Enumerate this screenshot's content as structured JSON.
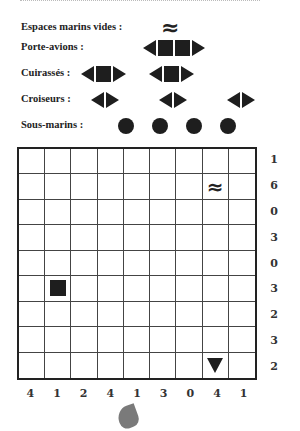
{
  "legend": {
    "water": {
      "label": "Espaces marins vides :",
      "symbol": "≈"
    },
    "carrier": {
      "label": "Porte-avions :",
      "count": 1,
      "length": 4
    },
    "battleship": {
      "label": "Cuirassés :",
      "count": 2,
      "length": 3
    },
    "cruiser": {
      "label": "Croiseurs :",
      "count": 3,
      "length": 2
    },
    "submarine": {
      "label": "Sous-marins :",
      "count": 4,
      "length": 1
    }
  },
  "grid": {
    "rows": 9,
    "cols": 9,
    "row_clues": [
      "1",
      "6",
      "0",
      "3",
      "0",
      "3",
      "2",
      "3",
      "2"
    ],
    "col_clues": [
      "4",
      "1",
      "2",
      "4",
      "1",
      "3",
      "0",
      "4",
      "1"
    ],
    "given_cells": [
      {
        "row": 1,
        "col": 7,
        "type": "water",
        "symbol": "≈"
      },
      {
        "row": 5,
        "col": 1,
        "type": "ship-middle"
      },
      {
        "row": 8,
        "col": 7,
        "type": "ship-end-bottom"
      }
    ]
  },
  "colors": {
    "ink": "#1e1e1e",
    "background": "#ffffff",
    "grid_line": "#444444"
  }
}
